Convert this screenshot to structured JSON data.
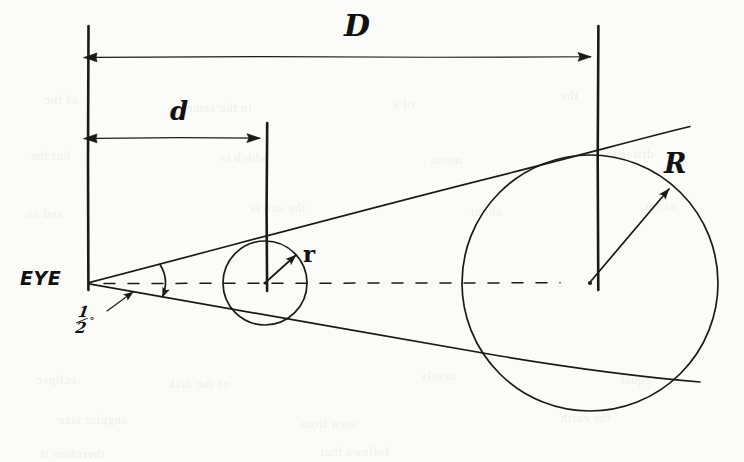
{
  "figure": {
    "kind": "hand-drawn-geometry-diagram",
    "medium": "pencil sketch on off-white paper",
    "title_text": "",
    "background_color": "#fbfbfa",
    "ink_color": "#1a1a1a"
  },
  "labels": {
    "distance_far": "D",
    "distance_near": "d",
    "radius_far": "R",
    "radius_near": "r",
    "observer": "EYE",
    "angle_numerator": "1",
    "angle_denominator": "2",
    "angle_degree_symbol": "°"
  },
  "geometry": {
    "eye_apex": {
      "x": 88,
      "y": 283
    },
    "optical_axis_y": 283,
    "vertical_reference_lines": [
      {
        "name": "eye-vertical",
        "x": 88,
        "y_top": 26,
        "y_bottom": 290
      },
      {
        "name": "near-vertical",
        "x": 267,
        "y_top": 123,
        "y_bottom": 290
      },
      {
        "name": "far-vertical",
        "x": 598,
        "y_top": 26,
        "y_bottom": 290
      }
    ],
    "dimension_arrows": [
      {
        "name": "D",
        "y": 57,
        "x_start": 88,
        "x_end": 598,
        "label": "D"
      },
      {
        "name": "d",
        "y": 138,
        "x_start": 88,
        "x_end": 267,
        "label": "d"
      }
    ],
    "near_circle": {
      "cx": 265,
      "cy": 283,
      "r": 42
    },
    "far_circle": {
      "cx": 590,
      "cy": 283,
      "r": 128
    },
    "near_radius_arrow": {
      "from_x": 265,
      "from_y": 283,
      "to_x": 297,
      "to_y": 256
    },
    "far_radius_arrow": {
      "from_x": 590,
      "from_y": 283,
      "to_x": 672,
      "to_y": 186
    },
    "tangent_upper": {
      "x1": 88,
      "y1": 283,
      "x2": 690,
      "y2": 127
    },
    "tangent_lower": {
      "x1": 88,
      "y1": 283,
      "x2": 700,
      "y2": 382
    },
    "angle_arc": {
      "center_x": 88,
      "center_y": 283,
      "radius": 72
    },
    "angle_leader": {
      "x1": 108,
      "y1": 310,
      "x2": 134,
      "y2": 291
    }
  },
  "showthrough_text": [
    {
      "text": "of the",
      "x": 44,
      "y": 92
    },
    {
      "text": "in the same",
      "x": 186,
      "y": 100
    },
    {
      "text": "of a",
      "x": 392,
      "y": 96
    },
    {
      "text": "the",
      "x": 560,
      "y": 88
    },
    {
      "text": "but the",
      "x": 30,
      "y": 148
    },
    {
      "text": "which is",
      "x": 220,
      "y": 150
    },
    {
      "text": "moon",
      "x": 430,
      "y": 152
    },
    {
      "text": "distance",
      "x": 606,
      "y": 146
    },
    {
      "text": "and so",
      "x": 26,
      "y": 206
    },
    {
      "text": "the sun is",
      "x": 250,
      "y": 200
    },
    {
      "text": "about",
      "x": 470,
      "y": 204
    },
    {
      "text": "as far",
      "x": 644,
      "y": 198
    },
    {
      "text": "eclipse",
      "x": 36,
      "y": 372
    },
    {
      "text": "of the disk",
      "x": 168,
      "y": 376
    },
    {
      "text": "nearly",
      "x": 420,
      "y": 368
    },
    {
      "text": "equal",
      "x": 620,
      "y": 372
    },
    {
      "text": "angular size",
      "x": 58,
      "y": 412
    },
    {
      "text": "seen from",
      "x": 300,
      "y": 416
    },
    {
      "text": "the earth",
      "x": 560,
      "y": 410
    },
    {
      "text": "therefore it",
      "x": 40,
      "y": 446
    },
    {
      "text": "follows that",
      "x": 320,
      "y": 444
    }
  ]
}
